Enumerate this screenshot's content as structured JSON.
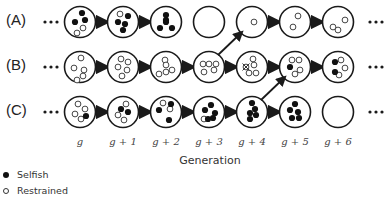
{
  "diagram": {
    "rows": [
      {
        "label": "(A)",
        "cells": [
          {
            "gen": "g",
            "selfish": [
              [
                2,
                -9
              ],
              [
                5,
                -2
              ],
              [
                -5,
                0
              ]
            ],
            "restrained": [
              [
                3,
                6
              ],
              [
                -3,
                11
              ]
            ],
            "crossed": []
          },
          {
            "gen": "g+1",
            "selfish": [
              [
                5,
                -6
              ],
              [
                -5,
                0
              ],
              [
                2,
                2
              ],
              [
                0,
                8
              ]
            ],
            "restrained": [
              [
                -3,
                -8
              ]
            ],
            "crossed": []
          },
          {
            "gen": "g+2",
            "selfish": [
              [
                0,
                -7
              ],
              [
                0,
                0
              ],
              [
                -6,
                6
              ],
              [
                6,
                6
              ],
              [
                0,
                -2
              ]
            ],
            "restrained": [],
            "crossed": []
          },
          {
            "gen": "g+3",
            "selfish": [],
            "restrained": [],
            "crossed": []
          },
          {
            "gen": "g+4",
            "selfish": [],
            "restrained": [
              [
                2,
                0
              ]
            ],
            "crossed": []
          },
          {
            "gen": "g+5",
            "selfish": [],
            "restrained": [
              [
                3,
                -6
              ],
              [
                -2,
                5
              ]
            ],
            "crossed": []
          },
          {
            "gen": "g+6",
            "selfish": [],
            "restrained": [
              [
                7,
                -2
              ],
              [
                -5,
                5
              ],
              [
                0,
                8
              ]
            ],
            "crossed": []
          }
        ]
      },
      {
        "label": "(B)",
        "cells": [
          {
            "gen": "g",
            "selfish": [],
            "restrained": [
              [
                1,
                -9
              ],
              [
                -6,
                1
              ],
              [
                4,
                3
              ],
              [
                3,
                9
              ],
              [
                -3,
                13
              ]
            ],
            "crossed": []
          },
          {
            "gen": "g+1",
            "selfish": [],
            "restrained": [
              [
                -2,
                -8
              ],
              [
                5,
                -5
              ],
              [
                -5,
                0
              ],
              [
                4,
                3
              ],
              [
                -1,
                9
              ]
            ],
            "crossed": []
          },
          {
            "gen": "g+2",
            "selfish": [],
            "restrained": [
              [
                -1,
                -7
              ],
              [
                0,
                -2
              ],
              [
                6,
                3
              ],
              [
                0,
                5
              ],
              [
                -7,
                7
              ]
            ],
            "crossed": []
          },
          {
            "gen": "g+3",
            "selfish": [],
            "restrained": [
              [
                -6,
                -3
              ],
              [
                0,
                -3
              ],
              [
                7,
                -3
              ],
              [
                -5,
                5
              ],
              [
                5,
                3
              ]
            ],
            "crossed": []
          },
          {
            "gen": "g+4",
            "selfish": [],
            "restrained": [
              [
                1,
                -8
              ],
              [
                2,
                -2
              ],
              [
                -3,
                6
              ],
              [
                4,
                6
              ]
            ],
            "crossed": [
              [
                -6,
                0
              ]
            ]
          },
          {
            "gen": "g+5",
            "selfish": [
              [
                -5,
                0
              ]
            ],
            "restrained": [
              [
                -3,
                -7
              ],
              [
                4,
                -7
              ],
              [
                5,
                3
              ],
              [
                0,
                7
              ]
            ],
            "crossed": []
          },
          {
            "gen": "g+6",
            "selfish": [
              [
                -3,
                -5
              ],
              [
                -3,
                5
              ]
            ],
            "restrained": [
              [
                3,
                -7
              ],
              [
                7,
                1
              ],
              [
                1,
                8
              ]
            ],
            "crossed": []
          }
        ]
      },
      {
        "label": "(C)",
        "cells": [
          {
            "gen": "g",
            "selfish": [
              [
                6,
                4
              ]
            ],
            "restrained": [
              [
                -2,
                -8
              ],
              [
                5,
                -3
              ],
              [
                -5,
                2
              ],
              [
                1,
                7
              ]
            ],
            "crossed": []
          },
          {
            "gen": "g+1",
            "selfish": [
              [
                -2,
                -3
              ],
              [
                5,
                0
              ]
            ],
            "restrained": [
              [
                3,
                -8
              ],
              [
                -5,
                3
              ],
              [
                1,
                8
              ]
            ],
            "crossed": []
          },
          {
            "gen": "g+2",
            "selfish": [
              [
                5,
                -8
              ],
              [
                -7,
                -2
              ],
              [
                3,
                8
              ]
            ],
            "restrained": [
              [
                -3,
                -9
              ],
              [
                4,
                -3
              ]
            ],
            "crossed": []
          },
          {
            "gen": "g+3",
            "selfish": [
              [
                2,
                -7
              ],
              [
                -4,
                -2
              ],
              [
                6,
                1
              ],
              [
                -1,
                7
              ],
              [
                4,
                6
              ]
            ],
            "restrained": [
              [
                -5,
                7
              ]
            ],
            "crossed": []
          },
          {
            "gen": "g+4",
            "selfish": [
              [
                0,
                -9
              ],
              [
                3,
                -3
              ],
              [
                -2,
                1
              ],
              [
                4,
                3
              ],
              [
                -2,
                7
              ]
            ],
            "restrained": [],
            "crossed": []
          },
          {
            "gen": "g+5",
            "selfish": [
              [
                0,
                -8
              ],
              [
                -5,
                -2
              ],
              [
                3,
                0
              ],
              [
                -3,
                6
              ],
              [
                4,
                6
              ]
            ],
            "restrained": [],
            "crossed": []
          },
          {
            "gen": "g+6",
            "selfish": [],
            "restrained": [],
            "crossed": []
          }
        ]
      }
    ],
    "ellipsis": "•••",
    "generation_labels": [
      "g",
      "g + 1",
      "g + 2",
      "g + 3",
      "g + 4",
      "g + 5",
      "g + 6"
    ],
    "axis_title": "Generation",
    "migration_arrows": [
      {
        "from": {
          "row": 1,
          "col": 3
        },
        "to": {
          "row": 0,
          "col": 4
        }
      },
      {
        "from": {
          "row": 2,
          "col": 4
        },
        "to": {
          "row": 1,
          "col": 5
        }
      }
    ],
    "horizontal_arrows": {
      "A": [
        [
          0,
          1
        ],
        [
          1,
          2
        ],
        [
          4,
          5
        ],
        [
          5,
          6
        ]
      ],
      "B": [
        [
          0,
          1
        ],
        [
          1,
          2
        ],
        [
          2,
          3
        ],
        [
          3,
          4
        ],
        [
          4,
          5
        ],
        [
          5,
          6
        ]
      ],
      "C": [
        [
          0,
          1
        ],
        [
          1,
          2
        ],
        [
          2,
          3
        ],
        [
          3,
          4
        ],
        [
          4,
          5
        ]
      ]
    }
  },
  "legend": {
    "items": [
      {
        "type": "filled",
        "label": "Selfish"
      },
      {
        "type": "hollow",
        "label": "Restrained"
      }
    ]
  },
  "colors": {
    "ink": "#1a1a1a",
    "text": "#333333"
  }
}
